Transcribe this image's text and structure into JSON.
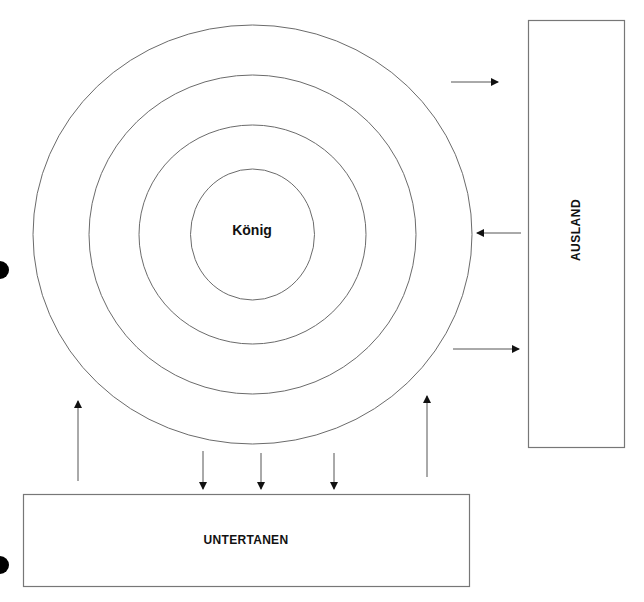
{
  "diagram": {
    "type": "concentric-power-diagram",
    "center_label": "König",
    "rings": 4,
    "boxes": {
      "right": {
        "label": "AUSLAND"
      },
      "bottom": {
        "label": "UNTERTANEN"
      }
    },
    "arrows": [
      {
        "from": "circle",
        "to": "AUSLAND",
        "direction": "right",
        "y": 82
      },
      {
        "from": "AUSLAND",
        "to": "circle",
        "direction": "left",
        "y": 233
      },
      {
        "from": "circle",
        "to": "AUSLAND",
        "direction": "right",
        "y": 349
      },
      {
        "from": "UNTERTANEN",
        "to": "circle",
        "direction": "up",
        "x": 78
      },
      {
        "from": "circle",
        "to": "UNTERTANEN",
        "direction": "down",
        "x": 203
      },
      {
        "from": "circle",
        "to": "UNTERTANEN",
        "direction": "down",
        "x": 261
      },
      {
        "from": "circle",
        "to": "UNTERTANEN",
        "direction": "down",
        "x": 334
      },
      {
        "from": "UNTERTANEN",
        "to": "circle",
        "direction": "up",
        "x": 427
      }
    ],
    "colors": {
      "line": "#6b6b6b",
      "arrow": "#111111",
      "dot": "#000000"
    }
  }
}
